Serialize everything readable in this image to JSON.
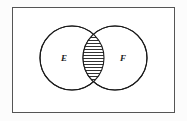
{
  "figure": {
    "kind": "venn-diagram",
    "caption": "",
    "canvas": {
      "width": 187,
      "height": 121
    },
    "background_color": "#fcfcfc"
  },
  "universe": {
    "label": "",
    "shape": "rectangle",
    "x": 12,
    "y": 7,
    "width": 163,
    "height": 106,
    "stroke_color": "#555555",
    "stroke_width": 1,
    "fill_color": "#ffffff"
  },
  "sets": [
    {
      "name": "set-e",
      "label": "E",
      "cx": 72,
      "cy": 58,
      "r": 32,
      "label_x": 64,
      "label_y": 58,
      "stroke_color": "#1a1a1a",
      "stroke_width": 1.1,
      "fill_color": "#ffffff"
    },
    {
      "name": "set-f",
      "label": "F",
      "cx": 115,
      "cy": 58,
      "r": 32,
      "label_x": 123,
      "label_y": 58,
      "stroke_color": "#1a1a1a",
      "stroke_width": 1.1,
      "fill_color": "#ffffff"
    }
  ],
  "intersection": {
    "name": "intersection-lens",
    "label": "",
    "shaded": true,
    "fill_pattern": "horizontal-hatch",
    "hatch_color": "#1a1a1a",
    "hatch_line_width": 0.9,
    "hatch_spacing": 3,
    "hatch_line_count": 17,
    "bounds": {
      "x_min": 83,
      "x_max": 104,
      "y_min": 32,
      "y_max": 84
    }
  }
}
